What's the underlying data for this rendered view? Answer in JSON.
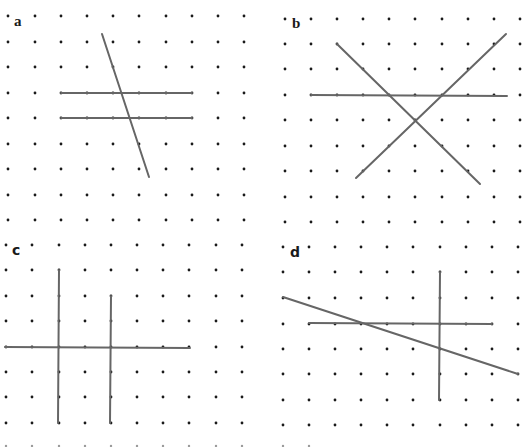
{
  "figure": {
    "width": 527,
    "height": 447,
    "colors": {
      "background": "#ffffff",
      "dot": "#1a1a1a",
      "line": "#666666"
    },
    "panels": [
      {
        "id": "a",
        "label": "a",
        "label_pos": [
          14,
          14
        ],
        "grid": {
          "xs": [
            8,
            35,
            61,
            87,
            113,
            139,
            166,
            192,
            218,
            244
          ],
          "ys": [
            16,
            42,
            67,
            93,
            118,
            144,
            169,
            195,
            220
          ]
        },
        "lines": [
          {
            "name": "parallel-line-top",
            "x1": 61,
            "y1": 93,
            "x2": 192,
            "y2": 93
          },
          {
            "name": "parallel-line-bottom",
            "x1": 61,
            "y1": 118,
            "x2": 192,
            "y2": 118
          },
          {
            "name": "transversal-line",
            "x1": 102,
            "y1": 34,
            "x2": 149,
            "y2": 177
          }
        ]
      },
      {
        "id": "b",
        "label": "b",
        "label_pos": [
          292,
          16
        ],
        "grid": {
          "xs": [
            285,
            311,
            337,
            363,
            389,
            415,
            442,
            468,
            494,
            520
          ],
          "ys": [
            19,
            44,
            69,
            95,
            120,
            146,
            171,
            197,
            222
          ]
        },
        "lines": [
          {
            "name": "horizontal-line",
            "x1": 311,
            "y1": 95,
            "x2": 507,
            "y2": 96
          },
          {
            "name": "diagonal-line-down",
            "x1": 337,
            "y1": 44,
            "x2": 480,
            "y2": 184
          },
          {
            "name": "diagonal-line-up",
            "x1": 356,
            "y1": 178,
            "x2": 506,
            "y2": 34
          }
        ]
      },
      {
        "id": "c",
        "label": "c",
        "label_pos": [
          12,
          243
        ],
        "grid": {
          "xs": [
            6,
            32,
            59,
            85,
            111,
            137,
            163,
            189,
            216,
            242
          ],
          "ys": [
            245,
            270,
            296,
            321,
            347,
            372,
            397,
            423
          ]
        },
        "lines": [
          {
            "name": "horizontal-line",
            "x1": 5,
            "y1": 347,
            "x2": 190,
            "y2": 348
          },
          {
            "name": "vertical-line-left",
            "x1": 59,
            "y1": 270,
            "x2": 58,
            "y2": 423
          },
          {
            "name": "vertical-line-right",
            "x1": 111,
            "y1": 296,
            "x2": 110,
            "y2": 423
          }
        ]
      },
      {
        "id": "d",
        "label": "d",
        "label_pos": [
          290,
          245
        ],
        "grid": {
          "xs": [
            283,
            309,
            335,
            361,
            387,
            413,
            440,
            466,
            492,
            518
          ],
          "ys": [
            247,
            272,
            298,
            324,
            349,
            374,
            400,
            425
          ]
        },
        "lines": [
          {
            "name": "horizontal-line",
            "x1": 309,
            "y1": 323,
            "x2": 492,
            "y2": 324
          },
          {
            "name": "vertical-line",
            "x1": 440,
            "y1": 272,
            "x2": 439,
            "y2": 400
          },
          {
            "name": "slanted-line",
            "x1": 283,
            "y1": 297,
            "x2": 518,
            "y2": 374
          }
        ]
      }
    ],
    "extra_rows": [
      {
        "y": 446,
        "xs": [
          6,
          32,
          59,
          85,
          111,
          137,
          163,
          189,
          216,
          242,
          283,
          309
        ]
      }
    ]
  }
}
